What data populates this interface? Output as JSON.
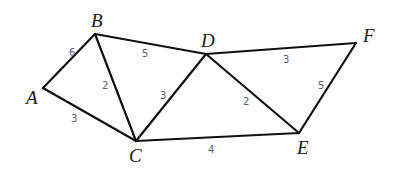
{
  "graph": {
    "vertices": [
      {
        "id": "A",
        "label": "A",
        "x": 43,
        "y": 88,
        "lx": 26,
        "ly": 104
      },
      {
        "id": "B",
        "label": "B",
        "x": 95,
        "y": 34,
        "lx": 91,
        "ly": 27
      },
      {
        "id": "C",
        "label": "C",
        "x": 136,
        "y": 141,
        "lx": 129,
        "ly": 162
      },
      {
        "id": "D",
        "label": "D",
        "x": 206,
        "y": 54,
        "lx": 201,
        "ly": 47
      },
      {
        "id": "E",
        "label": "E",
        "x": 299,
        "y": 133,
        "lx": 297,
        "ly": 154
      },
      {
        "id": "F",
        "label": "F",
        "x": 356,
        "y": 43,
        "lx": 363,
        "ly": 42
      }
    ],
    "edges": [
      {
        "from": "A",
        "to": "B",
        "weight": "6",
        "wx": 69,
        "wy": 56
      },
      {
        "from": "A",
        "to": "C",
        "weight": "3",
        "wx": 71,
        "wy": 122
      },
      {
        "from": "B",
        "to": "C",
        "weight": "2",
        "wx": 102,
        "wy": 89
      },
      {
        "from": "B",
        "to": "D",
        "weight": "5",
        "wx": 142,
        "wy": 57
      },
      {
        "from": "C",
        "to": "D",
        "weight": "3",
        "wx": 160,
        "wy": 99
      },
      {
        "from": "C",
        "to": "E",
        "weight": "4",
        "wx": 208,
        "wy": 153
      },
      {
        "from": "D",
        "to": "E",
        "weight": "2",
        "wx": 243,
        "wy": 105
      },
      {
        "from": "D",
        "to": "F",
        "weight": "3",
        "wx": 283,
        "wy": 63
      },
      {
        "from": "E",
        "to": "F",
        "weight": "5",
        "wx": 318,
        "wy": 89
      }
    ],
    "colors": {
      "edge": "#111111",
      "vertex_label": "#1a1a1a",
      "weight_label": "#5a5a84"
    }
  }
}
